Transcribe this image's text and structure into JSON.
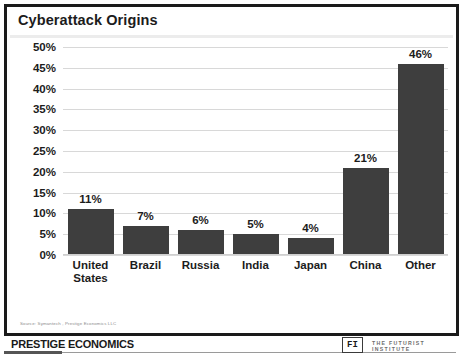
{
  "slide": {
    "title": "Cyberattack Origins",
    "source_note": "Source: Symantech , Prestige Economics LLC",
    "footer": {
      "brand": "PRESTIGE ECONOMICS",
      "partner_mark": "FI",
      "partner_name": "THE FUTURIST INSTITUTE"
    },
    "colors": {
      "bar": "#3e3e3e",
      "grid": "#d8d8d8",
      "frame": "#1a1a1a",
      "text": "#1c1c1c"
    }
  },
  "chart_data": {
    "type": "bar",
    "title": "Cyberattack Origins",
    "xlabel": "",
    "ylabel": "",
    "categories": [
      "United States",
      "Brazil",
      "Russia",
      "India",
      "Japan",
      "China",
      "Other"
    ],
    "values": [
      11,
      7,
      6,
      5,
      4,
      21,
      46
    ],
    "data_labels": [
      "11%",
      "7%",
      "6%",
      "5%",
      "4%",
      "21%",
      "46%"
    ],
    "ylim": [
      0,
      50
    ],
    "ytick_step": 5,
    "ytick_labels": [
      "50%",
      "45%",
      "40%",
      "35%",
      "30%",
      "25%",
      "20%",
      "15%",
      "10%",
      "5%",
      "0%"
    ],
    "ytick_values": [
      50,
      45,
      40,
      35,
      30,
      25,
      20,
      15,
      10,
      5,
      0
    ],
    "grid": true,
    "legend": false
  }
}
